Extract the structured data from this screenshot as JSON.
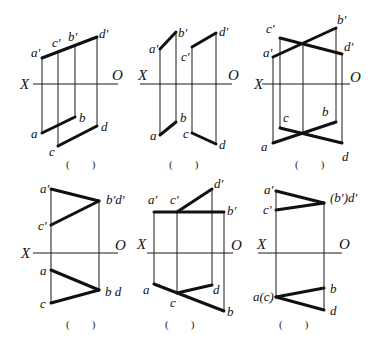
{
  "panels": [
    {
      "id": 1,
      "axis": {
        "x1": 33,
        "x2": 118,
        "y": 84,
        "X_label": {
          "text": "X",
          "x": 20,
          "y": 89
        },
        "O_label": {
          "text": "O",
          "x": 112,
          "y": 80
        }
      },
      "thin": [
        [
          42,
          58,
          42,
          133
        ],
        [
          58,
          50,
          58,
          146
        ],
        [
          75,
          46,
          75,
          117
        ],
        [
          97,
          37,
          97,
          126
        ]
      ],
      "thick": [
        [
          42,
          58,
          97,
          37
        ],
        [
          42,
          133,
          75,
          117
        ],
        [
          58,
          146,
          97,
          126
        ]
      ],
      "labels": [
        {
          "text": "a′",
          "x": 31,
          "y": 57
        },
        {
          "text": "c′",
          "x": 52,
          "y": 47
        },
        {
          "text": "b′",
          "x": 68,
          "y": 41
        },
        {
          "text": "d′",
          "x": 99,
          "y": 38
        },
        {
          "text": "a",
          "x": 31,
          "y": 138
        },
        {
          "text": "b",
          "x": 79,
          "y": 122
        },
        {
          "text": "c",
          "x": 49,
          "y": 156
        },
        {
          "text": "d",
          "x": 101,
          "y": 131
        }
      ],
      "answer": {
        "text": "(        )",
        "x": 66,
        "y": 168
      }
    },
    {
      "id": 2,
      "axis": {
        "x1": 140,
        "x2": 232,
        "y": 84,
        "X_label": {
          "text": "X",
          "x": 138,
          "y": 80
        },
        "O_label": {
          "text": "O",
          "x": 228,
          "y": 80
        }
      },
      "thin": [
        [
          160,
          49,
          160,
          135
        ],
        [
          176,
          32,
          176,
          122
        ],
        [
          192,
          47,
          192,
          133
        ],
        [
          216,
          33,
          216,
          144
        ]
      ],
      "thick": [
        [
          160,
          49,
          176,
          32
        ],
        [
          192,
          47,
          216,
          33
        ],
        [
          160,
          135,
          176,
          122
        ],
        [
          192,
          133,
          216,
          144
        ]
      ],
      "labels": [
        {
          "text": "a′",
          "x": 149,
          "y": 53
        },
        {
          "text": "b′",
          "x": 178,
          "y": 37
        },
        {
          "text": "c′",
          "x": 181,
          "y": 61
        },
        {
          "text": "d′",
          "x": 219,
          "y": 36
        },
        {
          "text": "a",
          "x": 150,
          "y": 140
        },
        {
          "text": "b",
          "x": 180,
          "y": 122
        },
        {
          "text": "c",
          "x": 183,
          "y": 138
        },
        {
          "text": "d",
          "x": 219,
          "y": 149
        }
      ],
      "answer": {
        "text": "(        )",
        "x": 169,
        "y": 168
      }
    },
    {
      "id": 3,
      "axis": {
        "x1": 262,
        "x2": 350,
        "y": 84,
        "X_label": {
          "text": "X",
          "x": 254,
          "y": 89
        },
        "O_label": {
          "text": "O",
          "x": 350,
          "y": 82
        }
      },
      "thin": [
        [
          273,
          57,
          273,
          143
        ],
        [
          280,
          38,
          280,
          128
        ],
        [
          303,
          43,
          303,
          133
        ],
        [
          336,
          28,
          336,
          122
        ],
        [
          342,
          54,
          342,
          143
        ]
      ],
      "thick": [
        [
          273,
          57,
          336,
          28
        ],
        [
          280,
          38,
          342,
          54
        ],
        [
          273,
          143,
          336,
          122
        ],
        [
          280,
          128,
          342,
          143
        ]
      ],
      "labels": [
        {
          "text": "c′",
          "x": 266,
          "y": 33
        },
        {
          "text": "b′",
          "x": 337,
          "y": 24
        },
        {
          "text": "a′",
          "x": 263,
          "y": 57
        },
        {
          "text": "d′",
          "x": 344,
          "y": 51
        },
        {
          "text": "c",
          "x": 283,
          "y": 122
        },
        {
          "text": "b",
          "x": 322,
          "y": 116
        },
        {
          "text": "a",
          "x": 261,
          "y": 151
        },
        {
          "text": "d",
          "x": 342,
          "y": 161
        }
      ],
      "answer": {
        "text": "(        )",
        "x": 295,
        "y": 168
      }
    },
    {
      "id": 4,
      "axis": {
        "x1": 33,
        "x2": 118,
        "y": 253,
        "X_label": {
          "text": "X",
          "x": 21,
          "y": 258
        },
        "O_label": {
          "text": "O",
          "x": 115,
          "y": 250
        }
      },
      "thin": [
        [
          51,
          189,
          51,
          303
        ],
        [
          99,
          201,
          99,
          290
        ]
      ],
      "thick": [
        [
          51,
          189,
          99,
          201
        ],
        [
          51,
          225,
          99,
          201
        ],
        [
          51,
          270,
          99,
          290
        ],
        [
          51,
          303,
          99,
          290
        ]
      ],
      "labels": [
        {
          "text": "a′",
          "x": 40,
          "y": 193
        },
        {
          "text": "b′d′",
          "x": 106,
          "y": 204
        },
        {
          "text": "c′",
          "x": 38,
          "y": 230
        },
        {
          "text": "a",
          "x": 40,
          "y": 275
        },
        {
          "text": "b d",
          "x": 105,
          "y": 296
        },
        {
          "text": "c",
          "x": 40,
          "y": 308
        }
      ],
      "answer": {
        "text": "(        )",
        "x": 66,
        "y": 328
      }
    },
    {
      "id": 5,
      "axis": {
        "x1": 147,
        "x2": 233,
        "y": 253,
        "X_label": {
          "text": "X",
          "x": 137,
          "y": 249
        },
        "O_label": {
          "text": "O",
          "x": 231,
          "y": 250
        }
      },
      "thin": [
        [
          154,
          212,
          154,
          284
        ],
        [
          177,
          212,
          177,
          293
        ],
        [
          212,
          189,
          212,
          285
        ],
        [
          224,
          212,
          224,
          311
        ]
      ],
      "thick": [
        [
          154,
          212,
          224,
          212
        ],
        [
          177,
          212,
          212,
          189
        ],
        [
          154,
          284,
          224,
          311
        ],
        [
          177,
          293,
          212,
          285
        ]
      ],
      "labels": [
        {
          "text": "a′",
          "x": 148,
          "y": 204
        },
        {
          "text": "c′",
          "x": 170,
          "y": 204
        },
        {
          "text": "d′",
          "x": 214,
          "y": 188
        },
        {
          "text": "b′",
          "x": 227,
          "y": 215
        },
        {
          "text": "a",
          "x": 143,
          "y": 294
        },
        {
          "text": "c",
          "x": 170,
          "y": 307
        },
        {
          "text": "d",
          "x": 213,
          "y": 294
        },
        {
          "text": "b",
          "x": 227,
          "y": 316
        }
      ],
      "answer": {
        "text": "(        )",
        "x": 165,
        "y": 328
      }
    },
    {
      "id": 6,
      "axis": {
        "x1": 258,
        "x2": 342,
        "y": 253,
        "X_label": {
          "text": "X",
          "x": 257,
          "y": 249
        },
        "O_label": {
          "text": "O",
          "x": 339,
          "y": 249
        }
      },
      "thin": [
        [
          276,
          191,
          276,
          297
        ],
        [
          324,
          203,
          324,
          310
        ]
      ],
      "thick": [
        [
          276,
          191,
          324,
          203
        ],
        [
          276,
          210,
          324,
          203
        ],
        [
          276,
          297,
          324,
          288
        ],
        [
          276,
          297,
          324,
          310
        ]
      ],
      "labels": [
        {
          "text": "a′",
          "x": 264,
          "y": 194
        },
        {
          "text": "c′",
          "x": 263,
          "y": 214
        },
        {
          "text": "(b′)d′",
          "x": 330,
          "y": 202
        },
        {
          "text": "a(c)",
          "x": 253,
          "y": 301
        },
        {
          "text": "b",
          "x": 330,
          "y": 293
        },
        {
          "text": "d",
          "x": 330,
          "y": 315
        }
      ],
      "answer": {
        "text": "(        )",
        "x": 279,
        "y": 328
      }
    }
  ]
}
